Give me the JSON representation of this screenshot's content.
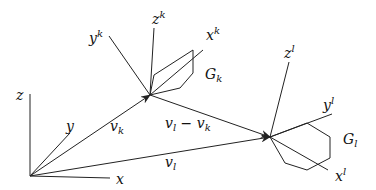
{
  "diagram": {
    "world_frame": {
      "origin": [
        30,
        176
      ],
      "axes": {
        "x": {
          "label": "x",
          "end": [
            110,
            178
          ]
        },
        "y": {
          "label": "y",
          "end": [
            70,
            133
          ]
        },
        "z": {
          "label": "z",
          "end": [
            30,
            94
          ]
        }
      }
    },
    "frame_k": {
      "origin": [
        150,
        95
      ],
      "axes": {
        "x": {
          "label": "x",
          "sup": "k",
          "end": [
            203,
            50
          ]
        },
        "y": {
          "label": "y",
          "sup": "k",
          "end": [
            109,
            36
          ]
        },
        "z": {
          "label": "z",
          "sup": "k",
          "end": [
            154,
            28
          ]
        }
      },
      "body": {
        "label": "G",
        "sub": "k"
      }
    },
    "frame_l": {
      "origin": [
        270,
        137
      ],
      "axes": {
        "x": {
          "label": "x",
          "sup": "l",
          "end": [
            328,
            170
          ]
        },
        "y": {
          "label": "y",
          "sup": "l",
          "end": [
            332,
            114
          ]
        },
        "z": {
          "label": "z",
          "sup": "l",
          "end": [
            289,
            62
          ]
        }
      },
      "body": {
        "label": "G",
        "sub": "l"
      }
    },
    "vectors": {
      "vk": {
        "label": "v",
        "sub": "k",
        "from": "O",
        "to": "k"
      },
      "vl": {
        "label": "v",
        "sub": "l",
        "from": "O",
        "to": "l"
      },
      "vl_minus_vk": {
        "label": "v",
        "sub1": "l",
        "minus": " − ",
        "label2": "v",
        "sub2": "k",
        "from": "k",
        "to": "l"
      }
    }
  }
}
